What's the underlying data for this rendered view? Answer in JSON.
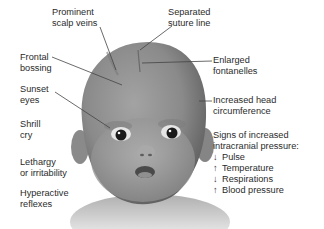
{
  "diagram": {
    "colors": {
      "background": "#ffffff",
      "text": "#2b2b2b",
      "skin": "#8f8f8f",
      "leader_line": "#444444"
    },
    "left_labels": [
      {
        "id": "prominent-scalp-veins",
        "lines": [
          "Prominent",
          "scalp veins"
        ]
      },
      {
        "id": "frontal-bossing",
        "lines": [
          "Frontal",
          "bossing"
        ]
      },
      {
        "id": "sunset-eyes",
        "lines": [
          "Sunset",
          "eyes"
        ]
      },
      {
        "id": "shrill-cry",
        "lines": [
          "Shrill",
          "cry"
        ]
      },
      {
        "id": "lethargy",
        "lines": [
          "Lethargy",
          "or irritability"
        ]
      },
      {
        "id": "hyperactive-reflexes",
        "lines": [
          "Hyperactive",
          "reflexes"
        ]
      }
    ],
    "right_labels": [
      {
        "id": "separated-suture-line",
        "lines": [
          "Separated",
          "suture line"
        ]
      },
      {
        "id": "enlarged-fontanelles",
        "lines": [
          "Enlarged",
          "fontanelles"
        ]
      },
      {
        "id": "increased-head-circumference",
        "lines": [
          "Increased head",
          "circumference"
        ]
      }
    ],
    "icp_signs": {
      "heading": [
        "Signs of increased",
        "intracranial pressure:"
      ],
      "items": [
        {
          "arrow": "↓",
          "direction": "down",
          "label": "Pulse"
        },
        {
          "arrow": "↑",
          "direction": "up",
          "label": "Temperature"
        },
        {
          "arrow": "↓",
          "direction": "down",
          "label": "Respirations"
        },
        {
          "arrow": "↑",
          "direction": "up",
          "label": "Blood pressure"
        }
      ]
    }
  }
}
